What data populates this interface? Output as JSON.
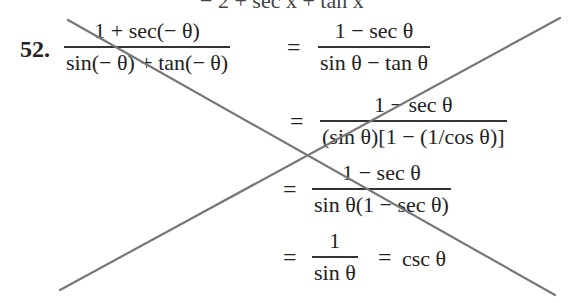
{
  "problem": {
    "number": "52.",
    "top_clipped_text": "−  2  +  sec x  +  tan x",
    "steps": [
      {
        "numerator": "1 + sec(− θ)",
        "denominator": "sin(− θ) + tan(− θ)",
        "rhs_numerator": "1 − sec θ",
        "rhs_denominator": "sin θ − tan θ"
      },
      {
        "numerator": "1 − sec θ",
        "denominator": "(sin θ)[1 − (1/cos θ)]"
      },
      {
        "numerator": "1 − sec θ",
        "denominator": "sin θ(1 − sec θ)"
      },
      {
        "numerator": "1",
        "denominator": "sin θ",
        "result": "csc θ"
      }
    ],
    "equals": "="
  },
  "strike_lines": {
    "color": "#777777",
    "line1": {
      "x1": 68,
      "y1": 20,
      "x2": 555,
      "y2": 295
    },
    "line2": {
      "x1": 60,
      "y1": 290,
      "x2": 560,
      "y2": 18
    }
  }
}
